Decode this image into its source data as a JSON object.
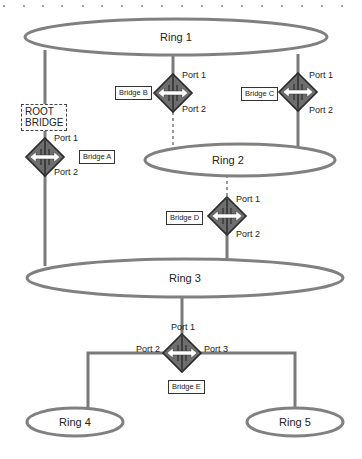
{
  "diagram": {
    "colors": {
      "line": "#7a7a7a",
      "ring_stroke": "#808080",
      "bridge_fill": "#6e6e6e",
      "bridge_stroke": "#2a2a2a",
      "arrow": "#ffffff",
      "dashed_link": "#9a9a9a"
    },
    "rings": [
      {
        "id": "ring1",
        "label": "Ring 1"
      },
      {
        "id": "ring2",
        "label": "Ring 2"
      },
      {
        "id": "ring3",
        "label": "Ring 3"
      },
      {
        "id": "ring4",
        "label": "Ring 4"
      },
      {
        "id": "ring5",
        "label": "Ring 5"
      }
    ],
    "root_bridge": {
      "line1": "ROOT",
      "line2": "BRIDGE"
    },
    "bridges": {
      "a": {
        "label": "Bridge A",
        "port1": "Port 1",
        "port2": "Port 2"
      },
      "b": {
        "label": "Bridge B",
        "port1": "Port 1",
        "port2": "Port 2"
      },
      "c": {
        "label": "Bridge C",
        "port1": "Port 1",
        "port2": "Port 2"
      },
      "d": {
        "label": "Bridge D",
        "port1": "Port 1",
        "port2": "Port 2"
      },
      "e": {
        "label": "Bridge E",
        "port1": "Port 1",
        "port2": "Port 2",
        "port3": "Port 3"
      }
    },
    "links": [
      {
        "from": "Ring 1",
        "to": "Bridge A Port 1",
        "style": "solid"
      },
      {
        "from": "Bridge A Port 2",
        "to": "Ring 3",
        "style": "solid"
      },
      {
        "from": "Ring 1",
        "to": "Bridge B Port 1",
        "style": "solid"
      },
      {
        "from": "Bridge B Port 2",
        "to": "Ring 2",
        "style": "dashed (blocked)"
      },
      {
        "from": "Ring 1",
        "to": "Bridge C Port 1",
        "style": "solid"
      },
      {
        "from": "Bridge C Port 2",
        "to": "Ring 2",
        "style": "solid"
      },
      {
        "from": "Ring 2",
        "to": "Bridge D Port 1",
        "style": "dashed (blocked)"
      },
      {
        "from": "Bridge D Port 2",
        "to": "Ring 3",
        "style": "solid"
      },
      {
        "from": "Ring 3",
        "to": "Bridge E Port 1",
        "style": "solid"
      },
      {
        "from": "Bridge E Port 2",
        "to": "Ring 4",
        "style": "solid"
      },
      {
        "from": "Bridge E Port 3",
        "to": "Ring 5",
        "style": "solid"
      }
    ]
  }
}
